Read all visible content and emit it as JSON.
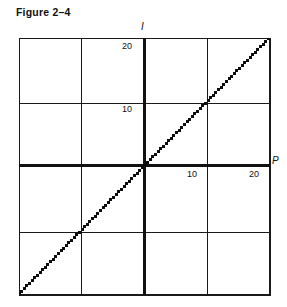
{
  "figure": {
    "title": "Figure 2–4",
    "background_color": "#ffffff",
    "ink_color": "#111111"
  },
  "chart_data": {
    "type": "line",
    "title": "Figure 2–4",
    "xlabel": "P",
    "ylabel": "I",
    "xlim": [
      -20,
      20
    ],
    "ylim": [
      -10,
      30
    ],
    "grid": true,
    "grid_step_x": 10,
    "grid_step_y": 10,
    "legend": "none",
    "line_style": "dotted",
    "x_tick_labels": [
      {
        "value": 10,
        "label": "10"
      },
      {
        "value": 20,
        "label": "20"
      }
    ],
    "y_tick_labels": [
      {
        "value": 10,
        "label": "10"
      },
      {
        "value": 20,
        "label": "20"
      }
    ],
    "axis_names": {
      "x": "P",
      "y": "I"
    },
    "series": [
      {
        "name": "I",
        "style": "dotted",
        "slope": 1,
        "intercept": 10,
        "x": [
          -20,
          -17.5,
          -15,
          -12.5,
          -10,
          -7.5,
          -5,
          -2.5,
          0,
          2.5,
          5,
          7.5,
          10,
          12.5
        ],
        "y": [
          -10,
          -7.5,
          -5,
          -2.5,
          0,
          2.5,
          5,
          7.5,
          10,
          12.5,
          15,
          17.5,
          20,
          22.5
        ]
      }
    ]
  },
  "labels": {
    "y_20": "20",
    "y_10": "10",
    "x_10": "10",
    "x_20": "20",
    "axis_i": "I",
    "axis_p": "P"
  }
}
